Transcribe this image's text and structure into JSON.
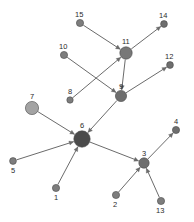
{
  "graph": {
    "title": "Directed network graph with 15 labeled nodes",
    "background_color": "#ffffff",
    "edge_color": "#6b6b6b",
    "label_color": "#2b2b2b",
    "node_default_fill": "#7d7d7d",
    "hub_fill": "#4b4b4b",
    "light_node_fill": "#a3a3a3",
    "nodes": [
      {
        "id": "1",
        "label": "1",
        "x": 56,
        "y": 188,
        "r": 3.6,
        "fill": "#7d7d7d",
        "label_dx": -2,
        "label_dy": 6,
        "role": "leaf"
      },
      {
        "id": "2",
        "label": "2",
        "x": 116,
        "y": 195,
        "r": 3.6,
        "fill": "#7d7d7d",
        "label_dx": -3,
        "label_dy": 6,
        "role": "leaf"
      },
      {
        "id": "3",
        "label": "3",
        "x": 144,
        "y": 163,
        "r": 5.2,
        "fill": "#6e6e6e",
        "label_dx": -2,
        "label_dy": -13,
        "role": "hub"
      },
      {
        "id": "4",
        "label": "4",
        "x": 176,
        "y": 130,
        "r": 3.6,
        "fill": "#6e6e6e",
        "label_dx": -2,
        "label_dy": -12,
        "role": "leaf"
      },
      {
        "id": "5",
        "label": "5",
        "x": 13,
        "y": 161,
        "r": 3.4,
        "fill": "#7d7d7d",
        "label_dx": -2,
        "label_dy": 6,
        "role": "leaf"
      },
      {
        "id": "6",
        "label": "6",
        "x": 82,
        "y": 139,
        "r": 8.2,
        "fill": "#4b4b4b",
        "label_dx": -2,
        "label_dy": -17,
        "role": "main-hub"
      },
      {
        "id": "7",
        "label": "7",
        "x": 32,
        "y": 108,
        "r": 6.6,
        "fill": "#a3a3a3",
        "label_dx": -2,
        "label_dy": -15,
        "role": "hub"
      },
      {
        "id": "8",
        "label": "8",
        "x": 70,
        "y": 100,
        "r": 3.2,
        "fill": "#7d7d7d",
        "label_dx": -2,
        "label_dy": -12,
        "role": "leaf"
      },
      {
        "id": "9",
        "label": "9",
        "x": 121,
        "y": 96,
        "r": 5.6,
        "fill": "#6e6e6e",
        "label_dx": -2,
        "label_dy": -13,
        "role": "hub"
      },
      {
        "id": "10",
        "label": "10",
        "x": 64,
        "y": 55,
        "r": 3.6,
        "fill": "#7d7d7d",
        "label_dx": -5,
        "label_dy": -12,
        "role": "leaf"
      },
      {
        "id": "11",
        "label": "11",
        "x": 126,
        "y": 53,
        "r": 6.2,
        "fill": "#787878",
        "label_dx": -4,
        "label_dy": -15,
        "role": "hub"
      },
      {
        "id": "12",
        "label": "12",
        "x": 170,
        "y": 65,
        "r": 3.4,
        "fill": "#6e6e6e",
        "label_dx": -5,
        "label_dy": -12,
        "role": "leaf"
      },
      {
        "id": "13",
        "label": "13",
        "x": 161,
        "y": 201,
        "r": 3.6,
        "fill": "#7d7d7d",
        "label_dx": -5,
        "label_dy": 6,
        "role": "leaf"
      },
      {
        "id": "14",
        "label": "14",
        "x": 164,
        "y": 24,
        "r": 3.4,
        "fill": "#6e6e6e",
        "label_dx": -5,
        "label_dy": -12,
        "role": "leaf"
      },
      {
        "id": "15",
        "label": "15",
        "x": 80,
        "y": 23,
        "r": 3.6,
        "fill": "#7d7d7d",
        "label_dx": -5,
        "label_dy": -12,
        "role": "leaf"
      }
    ],
    "edges": [
      {
        "from": "15",
        "to": "11",
        "arrow_at": "11"
      },
      {
        "from": "11",
        "to": "14",
        "arrow_at": "14"
      },
      {
        "from": "8",
        "to": "11",
        "arrow_at": "11"
      },
      {
        "from": "10",
        "to": "9",
        "arrow_at": "9"
      },
      {
        "from": "11",
        "to": "9",
        "arrow_at": "9"
      },
      {
        "from": "9",
        "to": "12",
        "arrow_at": "12"
      },
      {
        "from": "9",
        "to": "6",
        "arrow_at": "6"
      },
      {
        "from": "7",
        "to": "6",
        "arrow_at": "6"
      },
      {
        "from": "5",
        "to": "6",
        "arrow_at": "6"
      },
      {
        "from": "1",
        "to": "6",
        "arrow_at": "6"
      },
      {
        "from": "6",
        "to": "3",
        "arrow_at": "3"
      },
      {
        "from": "3",
        "to": "4",
        "arrow_at": "4"
      },
      {
        "from": "2",
        "to": "3",
        "arrow_at": "3"
      },
      {
        "from": "13",
        "to": "3",
        "arrow_at": "3"
      }
    ]
  }
}
